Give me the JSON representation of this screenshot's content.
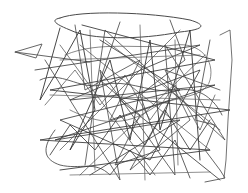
{
  "image": {
    "subject": "abstract scribble",
    "width": 248,
    "height": 193,
    "background": "#ffffff",
    "stroke_color": "#3a3a3a",
    "stroke_color_light": "#6a6a6a"
  },
  "strokes": [
    {
      "w": 1.0,
      "c": "#4a4a4a",
      "d": "M60,18 C80,10 150,12 190,20 C210,26 200,30 180,32 C140,40 90,40 70,30 C55,24 50,20 60,18"
    },
    {
      "w": 0.9,
      "c": "#555555",
      "d": "M15,52 L42,44 L36,58 L15,52 L90,62"
    },
    {
      "w": 0.9,
      "c": "#333333",
      "d": "M60,28 L40,100 L55,75 L80,30 L95,110 L70,150 L110,60 L130,140 L150,40 L160,130 L190,30 L200,160"
    },
    {
      "w": 0.9,
      "c": "#3d3d3d",
      "d": "M82,25 L215,60 L50,90 L230,110 L40,140 L210,150 L60,170"
    },
    {
      "w": 0.8,
      "c": "#444444",
      "d": "M45,60 L120,180 L100,70 L175,175 L165,45 L225,140 L105,30 L85,165"
    },
    {
      "w": 0.8,
      "c": "#2f2f2f",
      "d": "M100,40 L180,90 L60,120 L150,160 L200,70 L120,100 L220,180"
    },
    {
      "w": 0.9,
      "c": "#555555",
      "d": "M210,40 L195,120 L215,125 L205,150 L220,170 L225,178 L205,182"
    },
    {
      "w": 0.8,
      "c": "#4f4f4f",
      "d": "M220,35 L230,30 L232,60 L228,120 L226,160 L224,178"
    },
    {
      "w": 0.8,
      "c": "#3a3a3a",
      "d": "M55,130 C40,150 45,160 60,165 C80,170 95,160 110,175 L130,150 L150,175 L175,140 L190,178"
    },
    {
      "w": 0.8,
      "c": "#444444",
      "d": "M75,25 L85,90 L140,60 L110,120 L170,100 L130,170 L190,120 L165,70 L220,90"
    },
    {
      "w": 0.8,
      "c": "#333333",
      "d": "M35,70 L200,45 L70,100 L215,85 L55,140 L180,120 L90,175"
    },
    {
      "w": 0.7,
      "c": "#555555",
      "d": "M65,55 C100,40 140,50 175,45 C200,42 215,60 210,80 C205,100 170,95 150,110 C120,130 90,120 70,110"
    },
    {
      "w": 0.8,
      "c": "#3f3f3f",
      "d": "M120,22 L100,80 L140,115 L115,165 L160,150 L140,95 L185,60 L170,20"
    },
    {
      "w": 0.7,
      "c": "#4a4a4a",
      "d": "M45,105 L75,70 L100,105 L125,75 L150,120 L175,85 L200,130 L215,95"
    },
    {
      "w": 0.8,
      "c": "#2e2e2e",
      "d": "M50,155 L70,125 L95,150 L120,115 L145,145 L165,110 L190,150 L210,120"
    },
    {
      "w": 0.7,
      "c": "#555555",
      "d": "M90,30 L95,170 M140,25 L145,180 M175,40 L178,165"
    },
    {
      "w": 0.7,
      "c": "#606060",
      "d": "M70,175 L210,172 M60,60 L200,55 M50,95 L220,100"
    },
    {
      "w": 0.8,
      "c": "#3a3a3a",
      "d": "M40,80 C60,70 80,90 100,85 C130,78 150,95 180,90 C200,87 215,100 222,115"
    },
    {
      "w": 0.7,
      "c": "#484848",
      "d": "M60,45 L155,175 M80,45 L210,150 M105,40 L220,130 M180,30 L60,150 M205,55 L80,175"
    }
  ]
}
